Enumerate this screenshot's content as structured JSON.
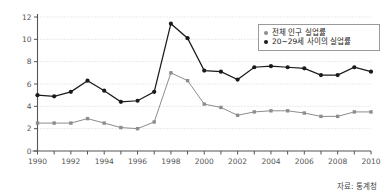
{
  "chart_data": {
    "type": "line",
    "title": "",
    "xlabel": "",
    "ylabel": "",
    "xlim": [
      1990,
      2010
    ],
    "ylim": [
      0,
      12
    ],
    "yticks": [
      0,
      2,
      4,
      6,
      8,
      10,
      12
    ],
    "xticks": [
      1990,
      1992,
      1994,
      1996,
      1998,
      2000,
      2002,
      2004,
      2006,
      2008,
      2010
    ],
    "x": [
      1990,
      1991,
      1992,
      1993,
      1994,
      1995,
      1996,
      1997,
      1998,
      1999,
      2000,
      2001,
      2002,
      2003,
      2004,
      2005,
      2006,
      2007,
      2008,
      2009,
      2010
    ],
    "grid": true,
    "grid_style": "dotted-horizontal",
    "legend_position": "top-right",
    "series": [
      {
        "name": "전체 인구 실업률",
        "color": "#8d8d8d",
        "marker": "square",
        "values": [
          2.5,
          2.5,
          2.5,
          2.9,
          2.5,
          2.1,
          2.0,
          2.6,
          7.0,
          6.3,
          4.2,
          3.9,
          3.2,
          3.5,
          3.6,
          3.6,
          3.4,
          3.1,
          3.1,
          3.5,
          3.5
        ]
      },
      {
        "name": "20~29세 사이의 실업률",
        "color": "#1a1a1a",
        "marker": "circle",
        "values": [
          5.0,
          4.9,
          5.3,
          6.3,
          5.4,
          4.4,
          4.5,
          5.3,
          11.4,
          10.1,
          7.2,
          7.1,
          6.4,
          7.5,
          7.6,
          7.5,
          7.4,
          6.8,
          6.8,
          7.5,
          7.1
        ]
      }
    ],
    "source_note": "자료: 통계청"
  },
  "legend": {
    "items": [
      {
        "label": "전체 인구 실업률"
      },
      {
        "label": "20~29세 사이의 실업률"
      }
    ]
  },
  "source": {
    "text": "자료: 통계청"
  }
}
